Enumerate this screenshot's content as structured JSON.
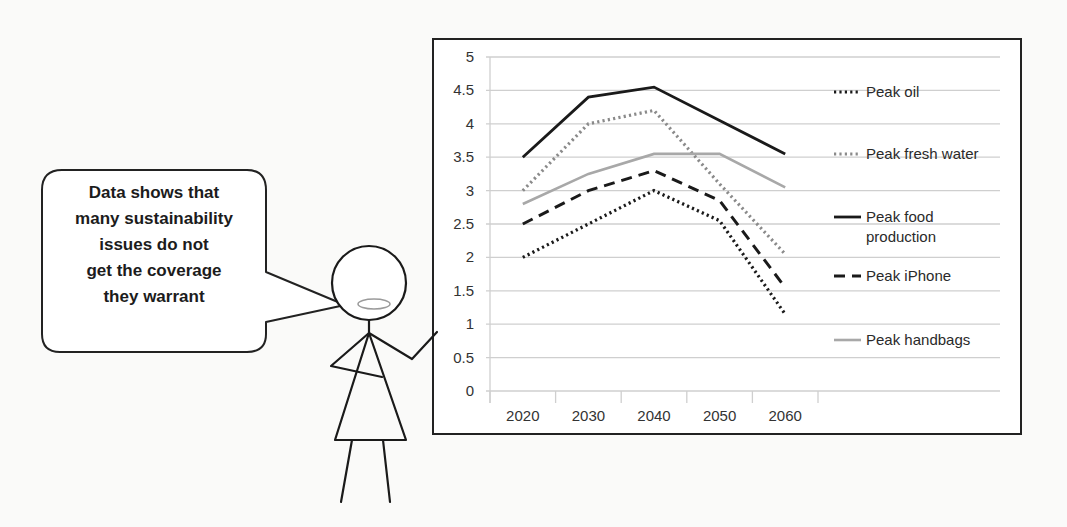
{
  "speech_bubble": {
    "lines": [
      "Data shows that",
      "many sustainability",
      "issues do not",
      "get the coverage",
      "they warrant"
    ]
  },
  "chart_data": {
    "type": "line",
    "title": "",
    "xlabel": "",
    "ylabel": "",
    "categories": [
      "2020",
      "2030",
      "2040",
      "2050",
      "2060"
    ],
    "x": [
      2020,
      2030,
      2040,
      2050,
      2060
    ],
    "ylim": [
      0,
      5
    ],
    "yticks": [
      "0",
      "0.5",
      "1",
      "1.5",
      "2",
      "2.5",
      "3",
      "3.5",
      "4",
      "4.5",
      "5"
    ],
    "grid": true,
    "legend_position": "right",
    "series": [
      {
        "name": "Peak oil",
        "style": "dotted",
        "color": "#1a1a1a",
        "values": [
          2.0,
          2.5,
          3.0,
          2.55,
          1.15
        ]
      },
      {
        "name": "Peak fresh water",
        "style": "dotted",
        "color": "#8a8a8a",
        "values": [
          3.0,
          4.0,
          4.2,
          3.1,
          2.05
        ]
      },
      {
        "name": "Peak food production",
        "style": "solid",
        "color": "#1a1a1a",
        "values": [
          3.5,
          4.4,
          4.55,
          4.05,
          3.55
        ]
      },
      {
        "name": "Peak iPhone",
        "style": "dashed",
        "color": "#1a1a1a",
        "values": [
          2.5,
          3.0,
          3.3,
          2.85,
          1.55
        ]
      },
      {
        "name": "Peak handbags",
        "style": "solid",
        "color": "#a8a8a8",
        "values": [
          2.8,
          3.25,
          3.55,
          3.55,
          3.05
        ]
      }
    ]
  },
  "legend": {
    "items": [
      {
        "label_lines": [
          "Peak oil"
        ]
      },
      {
        "label_lines": [
          "Peak fresh water"
        ]
      },
      {
        "label_lines": [
          "Peak food",
          "production"
        ]
      },
      {
        "label_lines": [
          "Peak iPhone"
        ]
      },
      {
        "label_lines": [
          "Peak handbags"
        ]
      }
    ]
  }
}
